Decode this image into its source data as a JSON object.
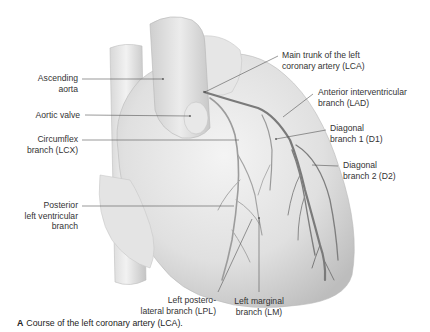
{
  "figure": {
    "title": "Course of the left coronary artery (LCA).",
    "panel_letter": "A",
    "colors": {
      "background": "#ffffff",
      "tissue": "#e2e2e2",
      "artery": "#8a8a8a",
      "text": "#333333",
      "leader": "#555555"
    }
  },
  "labels": {
    "ascending_aorta": {
      "line1": "Ascending",
      "line2": "aorta"
    },
    "aortic_valve": {
      "line1": "Aortic valve"
    },
    "circumflex": {
      "line1": "Circumflex",
      "line2": "branch (LCX)"
    },
    "posterior_lv": {
      "line1": "Posterior",
      "line2": "left ventricular",
      "line3": "branch"
    },
    "main_trunk": {
      "line1": "Main trunk of the left",
      "line2": "coronary artery (LCA)"
    },
    "lad": {
      "line1": "Anterior interventricular",
      "line2": "branch (LAD)"
    },
    "d1": {
      "line1": "Diagonal",
      "line2": "branch 1 (D1)"
    },
    "d2": {
      "line1": "Diagonal",
      "line2": "branch 2 (D2)"
    },
    "lpl": {
      "line1": "Left postero-",
      "line2": "lateral branch (LPL)"
    },
    "lm": {
      "line1": "Left marginal",
      "line2": "branch (LM)"
    }
  }
}
